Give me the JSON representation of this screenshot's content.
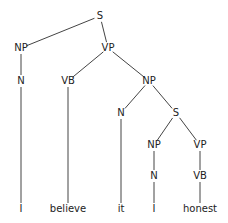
{
  "diagram": {
    "type": "syntax-tree",
    "nodes": [
      {
        "id": "s1",
        "label": "S",
        "x": 100,
        "y": 16
      },
      {
        "id": "np1",
        "label": "NP",
        "x": 21,
        "y": 48
      },
      {
        "id": "vp1",
        "label": "VP",
        "x": 108,
        "y": 48
      },
      {
        "id": "n1",
        "label": "N",
        "x": 21,
        "y": 81
      },
      {
        "id": "vb1",
        "label": "VB",
        "x": 68,
        "y": 81
      },
      {
        "id": "np2",
        "label": "NP",
        "x": 149,
        "y": 81
      },
      {
        "id": "n2",
        "label": "N",
        "x": 121,
        "y": 113
      },
      {
        "id": "s2",
        "label": "S",
        "x": 176,
        "y": 113
      },
      {
        "id": "np3",
        "label": "NP",
        "x": 154,
        "y": 145
      },
      {
        "id": "vp2",
        "label": "VP",
        "x": 200,
        "y": 145
      },
      {
        "id": "n3",
        "label": "N",
        "x": 154,
        "y": 176
      },
      {
        "id": "vb2",
        "label": "VB",
        "x": 200,
        "y": 176
      },
      {
        "id": "w1",
        "label": "I",
        "x": 21,
        "y": 209
      },
      {
        "id": "w2",
        "label": "believe",
        "x": 68,
        "y": 209
      },
      {
        "id": "w3",
        "label": "it",
        "x": 121,
        "y": 209
      },
      {
        "id": "w4",
        "label": "I",
        "x": 154,
        "y": 209
      },
      {
        "id": "w5",
        "label": "honest",
        "x": 200,
        "y": 209
      }
    ],
    "edges": [
      [
        "s1",
        "np1"
      ],
      [
        "s1",
        "vp1"
      ],
      [
        "np1",
        "n1"
      ],
      [
        "n1",
        "w1"
      ],
      [
        "vp1",
        "vb1"
      ],
      [
        "vp1",
        "np2"
      ],
      [
        "vb1",
        "w2"
      ],
      [
        "np2",
        "n2"
      ],
      [
        "np2",
        "s2"
      ],
      [
        "n2",
        "w3"
      ],
      [
        "s2",
        "np3"
      ],
      [
        "s2",
        "vp2"
      ],
      [
        "np3",
        "n3"
      ],
      [
        "n3",
        "w4"
      ],
      [
        "vp2",
        "vb2"
      ],
      [
        "vb2",
        "w5"
      ]
    ],
    "sentence": [
      "I",
      "believe",
      "it",
      "I",
      "honest"
    ],
    "colors": {
      "line": "#444444",
      "text": "#222222",
      "background": "#ffffff"
    }
  }
}
